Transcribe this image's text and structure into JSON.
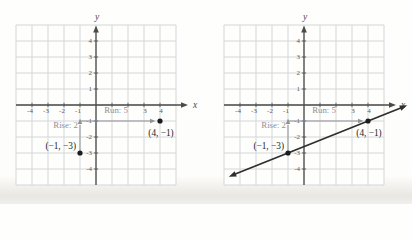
{
  "palette": {
    "grid": "#d4d7d9",
    "axis": "#4a4a4a",
    "tick_text": "#54575a",
    "annotation_text": "#8e9295",
    "arrow": "#8f9396",
    "point": "#1c1c1c",
    "point_text": "#242424",
    "line": "#2e2e2e",
    "paper": "#fcfcfa",
    "plot_background": "#fefefd"
  },
  "chart_data": [
    {
      "type": "scatter",
      "title": "",
      "xlabel": "x",
      "ylabel": "y",
      "xlim": [
        -5,
        5
      ],
      "ylim": [
        -5,
        5
      ],
      "grid": true,
      "x_tick_labels": [
        "-4",
        "-3",
        "-2",
        "-1",
        "3",
        "4"
      ],
      "y_tick_labels": [
        "4",
        "3",
        "2",
        "1",
        "-1",
        "-2",
        "-3",
        "-4"
      ],
      "points": [
        {
          "x": -1,
          "y": -3,
          "label": "(−1, −3)",
          "label_position": "left"
        },
        {
          "x": 4,
          "y": -1,
          "label": "(4, −1)",
          "label_position": "below"
        }
      ],
      "rise": {
        "label": "Rise: 2",
        "value": 2,
        "from": [
          -1,
          -3
        ],
        "to": [
          -1,
          -1
        ]
      },
      "run": {
        "label": "Run: 5",
        "value": 5,
        "from": [
          -1,
          -1
        ],
        "to": [
          4,
          -1
        ]
      },
      "line": null
    },
    {
      "type": "line",
      "title": "",
      "xlabel": "x",
      "ylabel": "y",
      "xlim": [
        -5,
        5
      ],
      "ylim": [
        -5,
        5
      ],
      "grid": true,
      "x_tick_labels": [
        "-4",
        "-3",
        "-2",
        "-1",
        "3",
        "4"
      ],
      "y_tick_labels": [
        "4",
        "3",
        "2",
        "1",
        "-1",
        "-2",
        "-3",
        "-4"
      ],
      "points": [
        {
          "x": -1,
          "y": -3,
          "label": "(−1, −3)",
          "label_position": "left"
        },
        {
          "x": 4,
          "y": -1,
          "label": "(4, −1)",
          "label_position": "below"
        }
      ],
      "rise": {
        "label": "Rise: 2",
        "value": 2,
        "from": [
          -1,
          -3
        ],
        "to": [
          -1,
          -1
        ]
      },
      "run": {
        "label": "Run: 5",
        "value": 5,
        "from": [
          -1,
          -1
        ],
        "to": [
          4,
          -1
        ]
      },
      "line": {
        "slope": 0.4,
        "through_point": [
          4,
          -1
        ],
        "draw_from_x": -4.7,
        "draw_to_x": 6.45,
        "arrowheads": "both"
      }
    }
  ]
}
